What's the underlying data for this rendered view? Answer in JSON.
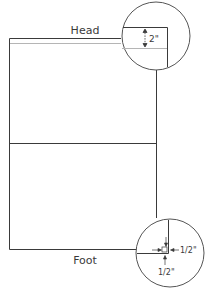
{
  "diagram": {
    "labels": {
      "head": "Head",
      "foot": "Foot"
    },
    "callouts": {
      "top_detail": {
        "measure": "2\"",
        "description": "head margin"
      },
      "bottom_detail": {
        "measure_side": "1/2\"",
        "measure_bottom": "1/2\"",
        "description": "corner margins"
      }
    },
    "colors": {
      "line": "#3a3a3a",
      "margin_line": "#b5b5b5",
      "circle": "#555555",
      "background": "#ffffff"
    }
  }
}
